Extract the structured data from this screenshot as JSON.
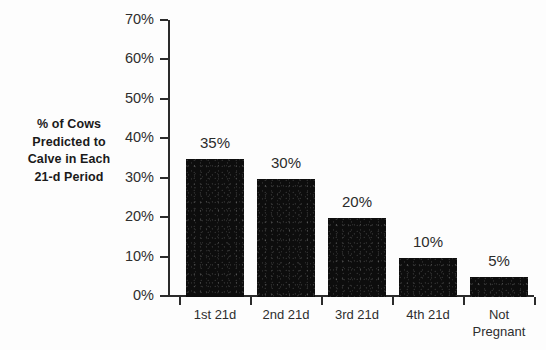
{
  "chart_data": {
    "type": "bar",
    "title": "",
    "subtitle": "",
    "xlabel": "",
    "ylabel": "% of Cows Predicted to Calve in Each 21-d Period",
    "ylabel_lines": [
      "% of Cows",
      "Predicted to",
      "Calve in Each",
      "21-d Period"
    ],
    "categories": [
      "1st 21d",
      "2nd 21d",
      "3rd 21d",
      "4th 21d",
      "Not Pregnant"
    ],
    "category_label_lines": [
      [
        "1st 21d"
      ],
      [
        "2nd 21d"
      ],
      [
        "3rd 21d"
      ],
      [
        "4th 21d"
      ],
      [
        "Not",
        "Pregnant"
      ]
    ],
    "values": [
      35,
      30,
      20,
      10,
      5
    ],
    "data_labels": [
      "35%",
      "30%",
      "20%",
      "10%",
      "5%"
    ],
    "ylim": [
      0,
      70
    ],
    "ytick_values": [
      0,
      10,
      20,
      30,
      40,
      50,
      60,
      70
    ],
    "ytick_labels": [
      "0%",
      "10%",
      "20%",
      "30%",
      "40%",
      "50%",
      "60%",
      "70%"
    ],
    "grid": false,
    "legend": false,
    "legend_position": "none",
    "bar_color": "#0d0d0d",
    "axis_color": "#2b2b2b",
    "background_color": "#fdfdfd",
    "annotations": []
  }
}
